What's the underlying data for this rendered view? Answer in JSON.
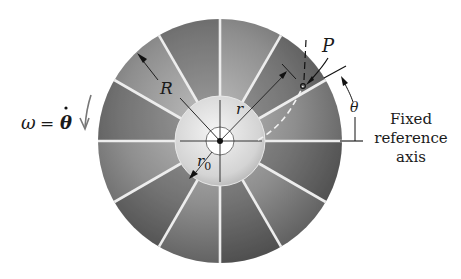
{
  "figure": {
    "center": [
      220,
      141
    ],
    "outer_radius": 122,
    "hub_radius": 45,
    "inner_radius": 14,
    "blade_count": 12,
    "colors": {
      "disk_dark": "#5e5e5e",
      "disk_mid": "#8a8a8a",
      "disk_light": "#b8b8b8",
      "hub": "#d9d9d9",
      "blade_line": "#eeeeee",
      "ink": "#1a1a1a"
    }
  },
  "labels": {
    "outer_radius": "R",
    "radial_position": "r",
    "inner_radius": "r",
    "inner_radius_sub": "0",
    "particle": "P",
    "angle": "θ",
    "omega_lhs": "ω",
    "omega_eq": "=",
    "omega_rhs": "θ",
    "omega_dot": "·",
    "reference_line1": "Fixed",
    "reference_line2": "reference",
    "reference_line3": "axis"
  }
}
